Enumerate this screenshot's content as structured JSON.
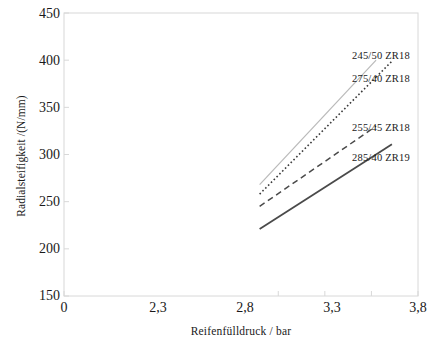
{
  "chart_data": {
    "type": "line",
    "title": "",
    "xlabel": "Reifenfülldruck / bar",
    "ylabel": "Radialsteifigkeit /(N/mm)",
    "xtick_labels": [
      "0",
      "2,3",
      "2,8",
      "3,3",
      "3,8"
    ],
    "xtick_values": [
      0,
      2.3,
      2.8,
      3.3,
      3.8
    ],
    "ytick_labels": [
      "150",
      "200",
      "250",
      "300",
      "350",
      "400",
      "450"
    ],
    "ytick_values": [
      150,
      200,
      250,
      300,
      350,
      400,
      450
    ],
    "xlim": [
      0,
      3.8
    ],
    "ylim": [
      150,
      450
    ],
    "grid": false,
    "legend_position": "right-inline",
    "series": [
      {
        "name": "245/50 ZR18",
        "style": "solid-light",
        "color": "#b9b9b9",
        "width": 1.2,
        "x": [
          2.1,
          3.35
        ],
        "values": [
          268,
          400
        ]
      },
      {
        "name": "275/40 ZR18",
        "style": "dotted",
        "color": "#3a3a3a",
        "width": 1.6,
        "x": [
          2.1,
          3.35
        ],
        "values": [
          258,
          382
        ]
      },
      {
        "name": "255/45 ZR18",
        "style": "dashed",
        "color": "#4a4a4a",
        "width": 1.5,
        "x": [
          2.1,
          3.35
        ],
        "values": [
          245,
          330
        ]
      },
      {
        "name": "285/40 ZR19",
        "style": "solid-dark",
        "color": "#4a4a4a",
        "width": 1.8,
        "x": [
          2.1,
          3.35
        ],
        "values": [
          221,
          300
        ]
      }
    ],
    "legend_labels": [
      "245/50 ZR18",
      "275/40 ZR18",
      "255/45 ZR18",
      "285/40 ZR19"
    ],
    "frame_color": "#d8d8d8"
  }
}
